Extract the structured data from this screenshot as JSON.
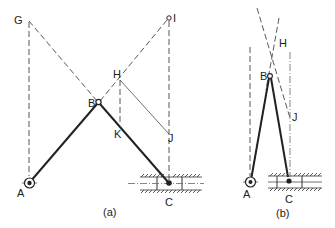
{
  "figure": {
    "panel_a": {
      "caption": "(a)",
      "labels": {
        "G": "G",
        "I": "I",
        "H": "H",
        "B": "B",
        "K": "K",
        "J": "J",
        "A": "A",
        "C": "C"
      }
    },
    "panel_b": {
      "caption": "(b)",
      "labels": {
        "H": "H",
        "B": "B",
        "J": "J",
        "A": "A",
        "C": "C"
      }
    },
    "colors": {
      "ink": "#222222",
      "background": "#ffffff"
    }
  }
}
